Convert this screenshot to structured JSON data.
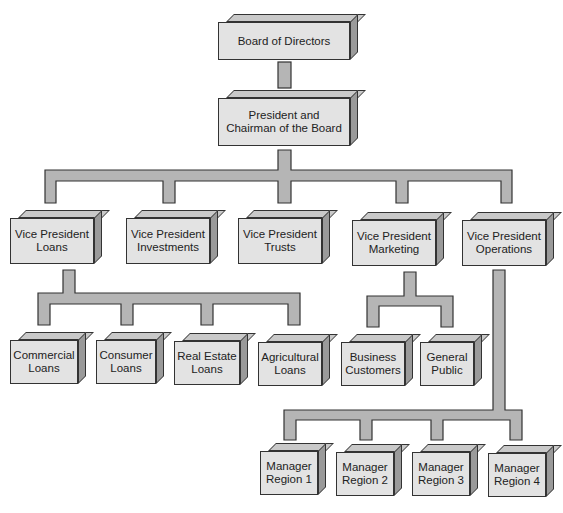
{
  "chart": {
    "colors": {
      "box_front": "#e3e3e3",
      "box_top": "#c9c9c9",
      "box_side": "#9a9a9a",
      "connector": "#b5b5b5",
      "outline": "#333333"
    },
    "nodes": {
      "board": "Board of Directors",
      "president": "President and\nChairman of the Board",
      "vp_loans": "Vice President\nLoans",
      "vp_investments": "Vice President\nInvestments",
      "vp_trusts": "Vice President\nTrusts",
      "vp_marketing": "Vice President\nMarketing",
      "vp_operations": "Vice President\nOperations",
      "commercial_loans": "Commercial\nLoans",
      "consumer_loans": "Consumer\nLoans",
      "real_estate_loans": "Real Estate\nLoans",
      "agricultural_loans": "Agricultural\nLoans",
      "business_customers": "Business\nCustomers",
      "general_public": "General\nPublic",
      "manager_region_1": "Manager\nRegion 1",
      "manager_region_2": "Manager\nRegion 2",
      "manager_region_3": "Manager\nRegion 3",
      "manager_region_4": "Manager\nRegion 4"
    },
    "edges": [
      [
        "board",
        "president"
      ],
      [
        "president",
        "vp_loans"
      ],
      [
        "president",
        "vp_investments"
      ],
      [
        "president",
        "vp_trusts"
      ],
      [
        "president",
        "vp_marketing"
      ],
      [
        "president",
        "vp_operations"
      ],
      [
        "vp_loans",
        "commercial_loans"
      ],
      [
        "vp_loans",
        "consumer_loans"
      ],
      [
        "vp_loans",
        "real_estate_loans"
      ],
      [
        "vp_loans",
        "agricultural_loans"
      ],
      [
        "vp_marketing",
        "business_customers"
      ],
      [
        "vp_marketing",
        "general_public"
      ],
      [
        "vp_operations",
        "manager_region_1"
      ],
      [
        "vp_operations",
        "manager_region_2"
      ],
      [
        "vp_operations",
        "manager_region_3"
      ],
      [
        "vp_operations",
        "manager_region_4"
      ]
    ]
  }
}
